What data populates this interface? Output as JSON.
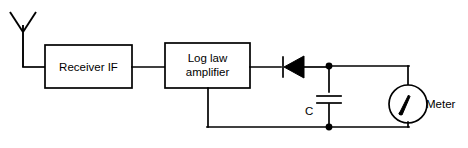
{
  "diagram": {
    "type": "circuit-block-diagram",
    "stroke_color": "#000000",
    "background_color": "#ffffff",
    "blocks": [
      {
        "id": "receiver-if",
        "label_line1": "Receiver IF",
        "label_line2": "",
        "x": 45,
        "y": 45,
        "width": 87,
        "height": 43
      },
      {
        "id": "log-law-amplifier",
        "label_line1": "Log law",
        "label_line2": "amplifier",
        "x": 165,
        "y": 43,
        "width": 85,
        "height": 45
      }
    ],
    "components": [
      {
        "id": "antenna",
        "name": "antenna",
        "label": "",
        "symbol": "dipole-y-antenna"
      },
      {
        "id": "diode",
        "name": "detector-diode",
        "label": "",
        "symbol": "diode",
        "orientation": "cathode-left"
      },
      {
        "id": "capacitor",
        "name": "smoothing-capacitor",
        "label": "C",
        "symbol": "capacitor",
        "orientation": "vertical"
      },
      {
        "id": "meter",
        "name": "meter",
        "label": "Meter",
        "symbol": "moving-coil-meter"
      }
    ],
    "junctions": [
      {
        "id": "top-node",
        "x": 329,
        "y": 66
      },
      {
        "id": "bottom-node",
        "x": 329,
        "y": 127
      }
    ]
  }
}
